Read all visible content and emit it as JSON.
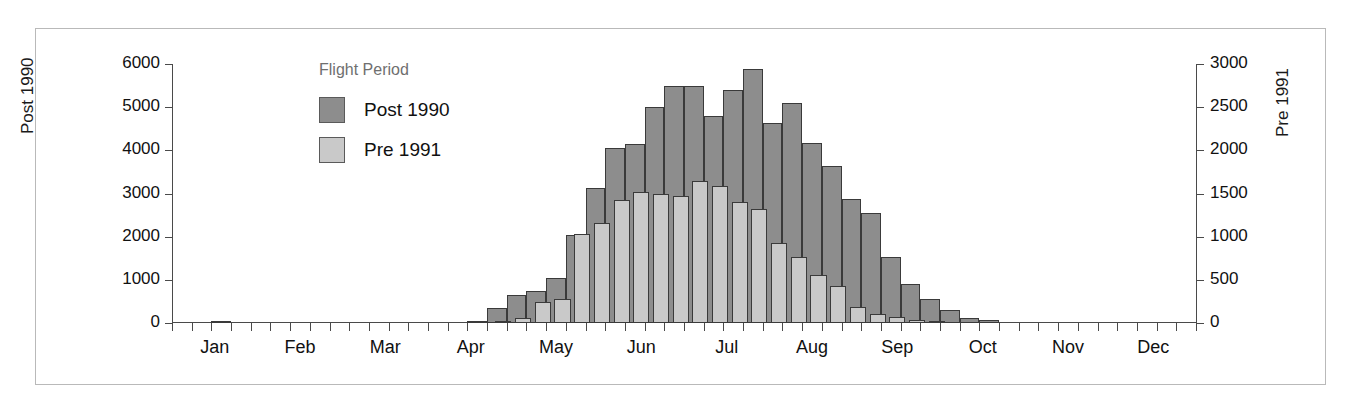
{
  "chart_data": {
    "type": "bar",
    "title": "",
    "subtitle": "",
    "xlabel": "",
    "ylabel": "Post 1990",
    "y2label": "Pre 1991",
    "ylim": [
      0,
      6000
    ],
    "y2lim": [
      0,
      3000
    ],
    "grid": false,
    "legend_position": "inside-top-left",
    "legend_title": "Flight Period",
    "x_tick_labels": [
      "Jan",
      "Feb",
      "Mar",
      "Apr",
      "May",
      "Jun",
      "Jul",
      "Aug",
      "Sep",
      "Oct",
      "Nov",
      "Dec"
    ],
    "y_tick_labels": [
      "0",
      "1000",
      "2000",
      "3000",
      "4000",
      "5000",
      "6000"
    ],
    "y2_tick_labels": [
      "0",
      "500",
      "1000",
      "1500",
      "2000",
      "2500",
      "3000"
    ],
    "y_ticks": [
      0,
      1000,
      2000,
      3000,
      4000,
      5000,
      6000
    ],
    "y2_ticks": [
      0,
      500,
      1000,
      1500,
      2000,
      2500,
      3000
    ],
    "x_bins": "weekly (52 bins across the year)",
    "series": [
      {
        "name": "Post 1990",
        "axis": "left",
        "color": "#8d8d8d",
        "values": [
          0,
          0,
          40,
          0,
          0,
          0,
          0,
          0,
          0,
          0,
          0,
          0,
          0,
          0,
          0,
          20,
          350,
          640,
          740,
          1050,
          2050,
          3120,
          4060,
          4150,
          5000,
          5500,
          5500,
          4790,
          5400,
          5880,
          4640,
          5100,
          4180,
          3640,
          2880,
          2560,
          1520,
          910,
          560,
          300,
          120,
          60,
          0,
          0,
          0,
          0,
          0,
          0,
          0,
          0,
          0,
          0
        ]
      },
      {
        "name": "Pre 1991",
        "axis": "right",
        "color": "#c9c9c9",
        "values": [
          0,
          0,
          0,
          0,
          0,
          0,
          0,
          0,
          0,
          0,
          0,
          0,
          0,
          0,
          0,
          0,
          10,
          60,
          240,
          280,
          1030,
          1160,
          1420,
          1520,
          1500,
          1470,
          1640,
          1590,
          1400,
          1320,
          930,
          760,
          560,
          430,
          190,
          100,
          70,
          30,
          10,
          0,
          0,
          0,
          0,
          0,
          0,
          0,
          0,
          0,
          0,
          0,
          0,
          0
        ]
      }
    ],
    "legend_entries": [
      {
        "label": "Post 1990",
        "color": "#8d8d8d"
      },
      {
        "label": "Pre 1991",
        "color": "#c9c9c9"
      }
    ]
  }
}
